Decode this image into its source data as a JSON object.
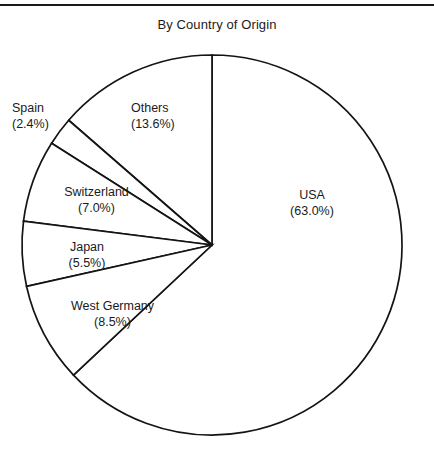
{
  "figure": {
    "title": "By Country of Origin",
    "background_color": "#ffffff",
    "line_color": "#141414",
    "text_color": "#1b1b1b"
  },
  "chart_data": {
    "type": "pie",
    "title": "By Country of Origin",
    "xlabel": "",
    "ylabel": "",
    "legend_position": "none",
    "grid": false,
    "units": "percent",
    "start_angle_deg": 90,
    "direction": "counterclockwise",
    "total": 100.0,
    "categories": [
      "USA",
      "Others",
      "Spain",
      "Switzerland",
      "Japan",
      "West Germany"
    ],
    "values": [
      63.0,
      13.6,
      2.4,
      7.0,
      5.5,
      8.5
    ],
    "slices": [
      {
        "name": "USA",
        "value": 63.0,
        "percent_label": "(63.0%)",
        "label_line1": "USA",
        "label_line2": "(63.0%)",
        "label_placement": "inside",
        "fill": "#ffffff"
      },
      {
        "name": "Others",
        "value": 13.6,
        "percent_label": "(13.6%)",
        "label_line1": "Others",
        "label_line2": "(13.6%)",
        "label_placement": "inside",
        "fill": "#ffffff"
      },
      {
        "name": "Spain",
        "value": 2.4,
        "percent_label": "(2.4%)",
        "label_line1": "Spain",
        "label_line2": "(2.4%)",
        "label_placement": "outside",
        "fill": "#ffffff"
      },
      {
        "name": "Switzerland",
        "value": 7.0,
        "percent_label": "(7.0%)",
        "label_line1": "Switzerland",
        "label_line2": "(7.0%)",
        "label_placement": "inside",
        "fill": "#ffffff"
      },
      {
        "name": "Japan",
        "value": 5.5,
        "percent_label": "(5.5%)",
        "label_line1": "Japan",
        "label_line2": "(5.5%)",
        "label_placement": "inside",
        "fill": "#ffffff"
      },
      {
        "name": "West Germany",
        "value": 8.5,
        "percent_label": "(8.5%)",
        "label_line1": "West Germany",
        "label_line2": "(8.5%)",
        "label_placement": "inside",
        "fill": "#ffffff"
      }
    ]
  }
}
